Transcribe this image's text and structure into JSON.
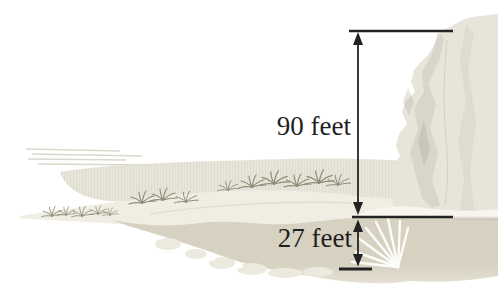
{
  "figure": {
    "alt": "Seaside cliff illustration with dimension arrows showing the cliff height above the water surface and the depth of the water below",
    "measurements": {
      "cliff_height": {
        "label": "90 feet",
        "value": 90,
        "unit": "feet"
      },
      "water_depth": {
        "label": "27 feet",
        "value": 27,
        "unit": "feet"
      }
    }
  },
  "theme": {
    "background": "#ffffff",
    "line_color": "#232323",
    "label_color": "#1f1f1f",
    "band": "#e3e0d4",
    "streak": "#d7d4c6",
    "sand": "#f0ede3",
    "water": "#d6d1c0",
    "water_deep": "#e4e0d3",
    "rock": "#eceadf",
    "cliff_base": "#e7e4da",
    "cliff_shadow": "#c9c6b9",
    "cliff_dark": "#b7b4a6",
    "ledge": "#f7f5ee",
    "grass": "#8c8c76",
    "sunburst": "#ffffff"
  }
}
